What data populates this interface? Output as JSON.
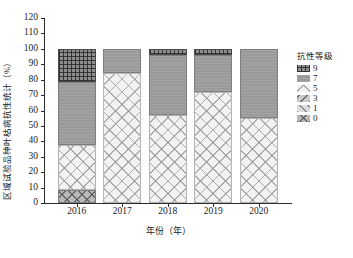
{
  "chart_data": {
    "type": "bar",
    "title": "",
    "xlabel": "年份（年）",
    "ylabel": "区域试验品种叶枯病抗性统计（%）",
    "categories": [
      "2016",
      "2017",
      "2018",
      "2019",
      "2020"
    ],
    "ylim": [
      0,
      120
    ],
    "yticks": [
      0,
      10,
      20,
      30,
      40,
      50,
      60,
      70,
      80,
      90,
      100,
      110,
      120
    ],
    "grid": false,
    "stacked": true,
    "legend_title": "抗性等级",
    "legend_position": "right",
    "series": [
      {
        "name": "0",
        "values": [
          8.5,
          0,
          0,
          0,
          0
        ]
      },
      {
        "name": "1",
        "values": [
          0,
          0,
          0,
          0,
          0
        ]
      },
      {
        "name": "3",
        "values": [
          0,
          0,
          0,
          0,
          0
        ]
      },
      {
        "name": "5",
        "values": [
          29.0,
          84.5,
          57.0,
          72.0,
          55.0
        ]
      },
      {
        "name": "7",
        "values": [
          41.0,
          15.5,
          39.0,
          24.0,
          45.0
        ]
      },
      {
        "name": "9",
        "values": [
          21.5,
          0,
          4.0,
          4.0,
          0
        ]
      }
    ]
  },
  "legend": {
    "title": "抗性等级",
    "items": [
      {
        "label": "9",
        "key": "lvl9"
      },
      {
        "label": "7",
        "key": "lvl7"
      },
      {
        "label": "5",
        "key": "lvl5"
      },
      {
        "label": "3",
        "key": "lvl3"
      },
      {
        "label": "1",
        "key": "lvl1"
      },
      {
        "label": "0",
        "key": "lvl0"
      }
    ]
  },
  "axes": {
    "y_title": "区域试验品种叶枯病抗性统计（%）",
    "x_title": "年份（年）"
  }
}
